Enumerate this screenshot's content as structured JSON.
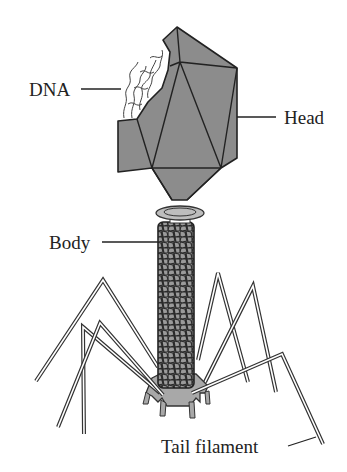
{
  "diagram": {
    "colors": {
      "head_fill": "#8c8c8c",
      "body_fill": "#9a9a9a",
      "outline": "#222222",
      "filament_fill": "#ffffff",
      "baseplate_fill": "#a8a8a8",
      "background": "#ffffff"
    },
    "labels": [
      {
        "id": "dna",
        "text": "DNA"
      },
      {
        "id": "head",
        "text": "Head"
      },
      {
        "id": "body",
        "text": "Body"
      },
      {
        "id": "tail_filament",
        "text": "Tail filament"
      }
    ]
  }
}
